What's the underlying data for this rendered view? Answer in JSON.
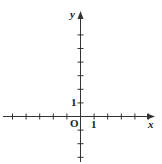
{
  "diagram": {
    "type": "cartesian-axes",
    "origin_label": "O",
    "x_axis_label": "x",
    "y_axis_label": "y",
    "x_unit_label": "1",
    "y_unit_label": "1",
    "x_ticks": [
      -5,
      -4,
      -3,
      -2,
      -1,
      1,
      2,
      3,
      4,
      5
    ],
    "y_ticks": [
      -3,
      -2,
      -1,
      1,
      2,
      3,
      4,
      5,
      6
    ],
    "axis_color": "#333333"
  }
}
